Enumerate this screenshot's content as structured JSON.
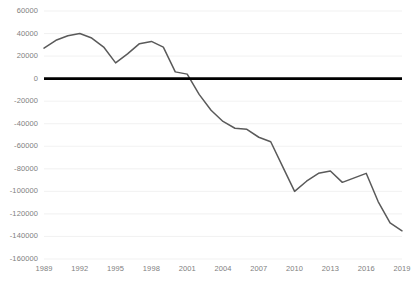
{
  "chart_data": {
    "type": "line",
    "title": "",
    "subtitle": "",
    "xlabel": "",
    "ylabel": "",
    "grid": true,
    "legend": false,
    "legend_position": "none",
    "line_color": "#5a5a5a",
    "zero_line_color": "#000000",
    "gridline_color": "#e8e8e8",
    "background_color": "#ffffff",
    "axis_label_color": "#808080",
    "xlim": [
      1989,
      2019
    ],
    "ylim": [
      -160000,
      60000
    ],
    "ytick_step": 20000,
    "xtick_step": 3,
    "yticks": [
      60000,
      40000,
      20000,
      0,
      -20000,
      -40000,
      -60000,
      -80000,
      -100000,
      -120000,
      -140000,
      -160000
    ],
    "ytick_labels": [
      "60000",
      "40000",
      "20000",
      "0",
      "-20000",
      "-40000",
      "-60000",
      "-80000",
      "-100000",
      "-120000",
      "-140000",
      "-160000"
    ],
    "xticks": [
      1989,
      1992,
      1995,
      1998,
      2001,
      2004,
      2007,
      2010,
      2013,
      2016,
      2019
    ],
    "xtick_labels": [
      "1989",
      "1992",
      "1995",
      "1998",
      "2001",
      "2004",
      "2007",
      "2010",
      "2013",
      "2016",
      "2019"
    ],
    "x": [
      1989,
      1990,
      1991,
      1992,
      1993,
      1994,
      1995,
      1996,
      1997,
      1998,
      1999,
      2000,
      2001,
      2002,
      2003,
      2004,
      2005,
      2006,
      2007,
      2008,
      2009,
      2010,
      2011,
      2012,
      2013,
      2014,
      2015,
      2016,
      2017,
      2018,
      2019
    ],
    "values": [
      27000,
      34000,
      38000,
      40000,
      36000,
      28000,
      14000,
      22000,
      31000,
      33000,
      28000,
      6000,
      4000,
      -14000,
      -28000,
      -38000,
      -44000,
      -45000,
      -52000,
      -56000,
      -78000,
      -100000,
      -91000,
      -84000,
      -82000,
      -92000,
      -88000,
      -84000,
      -109000,
      -128000,
      -135000
    ],
    "series": [
      {
        "name": "Series 1",
        "values": [
          27000,
          34000,
          38000,
          40000,
          36000,
          28000,
          14000,
          22000,
          31000,
          33000,
          28000,
          6000,
          4000,
          -14000,
          -28000,
          -38000,
          -44000,
          -45000,
          -52000,
          -56000,
          -78000,
          -100000,
          -91000,
          -84000,
          -82000,
          -92000,
          -88000,
          -84000,
          -109000,
          -128000,
          -135000
        ]
      }
    ]
  }
}
